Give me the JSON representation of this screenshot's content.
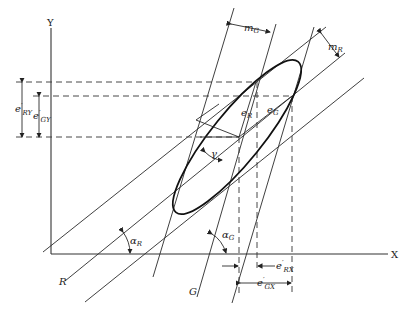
{
  "diagram": {
    "axes": {
      "x_label": "X",
      "y_label": "Y"
    },
    "line_families": [
      {
        "name": "R",
        "label": "R",
        "angle_label": "α",
        "angle_sub": "R",
        "spacing_label": "m",
        "spacing_sub": "R"
      },
      {
        "name": "G",
        "label": "G",
        "angle_label": "α",
        "angle_sub": "G",
        "spacing_label": "m",
        "spacing_sub": "G"
      }
    ],
    "ellipse_labels": {
      "e_R": {
        "main": "e",
        "sub": "R"
      },
      "e_G": {
        "main": "e",
        "sub": "G"
      },
      "gamma": "γ"
    },
    "dimension_labels": {
      "e_RY": {
        "main": "e",
        "sup": "′",
        "sub": "R",
        "sub2": "Y"
      },
      "e_GY": {
        "main": "e",
        "sup": "′",
        "sub": "G",
        "sub2": "Y"
      },
      "e_RX": {
        "main": "e",
        "sup": "′",
        "sub": "R",
        "sub2": "X"
      },
      "e_GX": {
        "main": "e",
        "sup": "′",
        "sub": "G",
        "sub2": "X"
      }
    }
  }
}
